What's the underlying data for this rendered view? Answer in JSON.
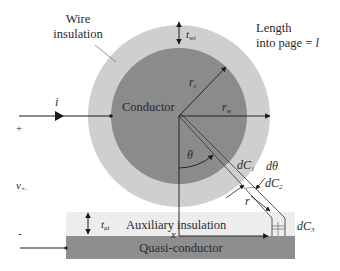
{
  "diagram": {
    "labels": {
      "wire_insulation_line1": "Wire",
      "wire_insulation_line2": "insulation",
      "length_line1": "Length",
      "length_line2": "into page = ",
      "length_symbol": "l",
      "conductor": "Conductor",
      "auxiliary_insulation": "Auxiliary insulation",
      "quasi_conductor": "Quasi-conductor",
      "current": "i",
      "plus": "+",
      "minus": "-",
      "voltage": "v",
      "voltage_sub": "+-",
      "t_wi": "t",
      "t_wi_sub": "wi",
      "t_ai": "t",
      "t_ai_sub": "ai",
      "r_c": "r",
      "r_c_sub": "c",
      "r_w": "r",
      "r_w_sub": "w",
      "theta": "θ",
      "d_theta": "dθ",
      "dC1": "dC",
      "dC1_sub": "1",
      "dC2": "dC",
      "dC2_sub": "2",
      "dC3": "dC",
      "dC3_sub": "3",
      "r": "r",
      "x": "x"
    },
    "colors": {
      "conductor": "#8c8c8c",
      "wire_insulation": "#cfcfcf",
      "auxiliary_insulation": "#ececec",
      "quasi_conductor": "#8e8e8e",
      "line": "#1a1a1a"
    }
  }
}
